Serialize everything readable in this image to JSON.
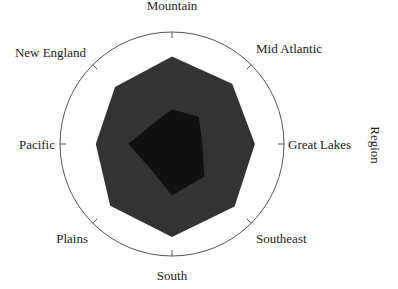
{
  "chart_data": {
    "type": "radar",
    "title": "",
    "axis_label": "Region",
    "categories": [
      "Mountain",
      "Mid Atlantic",
      "Great Lakes",
      "Southeast",
      "South",
      "Plains",
      "Pacific",
      "New England"
    ],
    "rmax": 100,
    "grid": false,
    "legend": "none",
    "series": [
      {
        "name": "Series 1",
        "color": "#333333",
        "values": [
          78,
          76,
          74,
          79,
          83,
          78,
          68,
          72
        ]
      },
      {
        "name": "Series 2",
        "color": "#111111",
        "values": [
          31,
          34,
          27,
          41,
          46,
          29,
          39,
          25
        ]
      }
    ]
  },
  "colors": {
    "outline": "#555555",
    "text": "#222222"
  }
}
